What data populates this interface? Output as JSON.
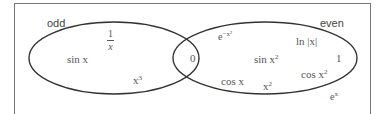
{
  "diagram": {
    "type": "venn",
    "sets": [
      {
        "name": "odd",
        "label": "odd"
      },
      {
        "name": "even",
        "label": "even"
      }
    ],
    "odd_only": {
      "items": [
        "1/x",
        "sin x",
        "x^3"
      ],
      "frac_num": "1",
      "frac_den": "x",
      "sin": "sin x",
      "cube_base": "x",
      "cube_exp": "3"
    },
    "intersection": {
      "items": [
        "0"
      ],
      "zero": "0"
    },
    "even_only": {
      "items": [
        "e^{-x^2}",
        "ln |x|",
        "sin x^2",
        "1",
        "cos x^2",
        "cos x",
        "x^2"
      ],
      "gauss_base": "e",
      "gauss_exp": "−x²",
      "ln": "ln |x|",
      "sinsq_base": "sin x",
      "sinsq_exp": "2",
      "one": "1",
      "cossq_base": "cos x",
      "cossq_exp": "2",
      "cos": "cos x",
      "sq_base": "x",
      "sq_exp": "2"
    },
    "outside": {
      "items": [
        "e^x"
      ],
      "exp_base": "e",
      "exp_exp": "x"
    },
    "colors": {
      "outline": "#333333",
      "frame": "#777777",
      "text": "#444444"
    }
  }
}
